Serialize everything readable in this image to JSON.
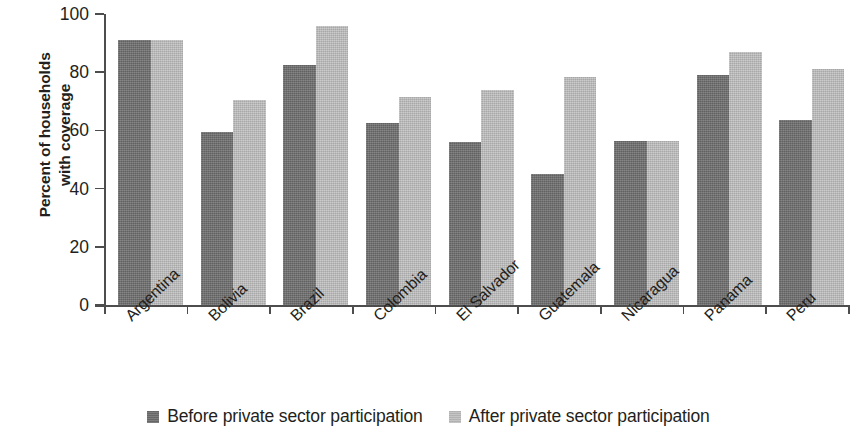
{
  "chart_data": {
    "type": "bar",
    "title": "",
    "subtitle": "",
    "xlabel": "",
    "ylabel": "Percent of households\nwith coverage",
    "ylabel_lines": [
      "Percent of households",
      "with coverage"
    ],
    "ylim": [
      0,
      100
    ],
    "yticks": [
      0,
      20,
      40,
      60,
      80,
      100
    ],
    "ytick_labels": [
      "0",
      "20",
      "40",
      "60",
      "80",
      "100"
    ],
    "grid": false,
    "legend_position": "bottom-center",
    "categories": [
      "Argentina",
      "Bolivia",
      "Brazil",
      "Colombia",
      "El Salvador",
      "Guatemala",
      "Nicaragua",
      "Panama",
      "Peru"
    ],
    "series": [
      {
        "name": "Before private sector participation",
        "color": "#6f6f6f",
        "values": [
          91,
          59.5,
          82.5,
          62.5,
          56,
          45,
          56.5,
          79,
          63.5
        ]
      },
      {
        "name": "After private sector participation",
        "color": "#bcbcbc",
        "values": [
          91,
          70.5,
          96,
          71.5,
          74,
          78.5,
          56.5,
          87,
          81
        ]
      }
    ],
    "axis_color": "#4d4d4d",
    "text_color": "#231f20"
  }
}
